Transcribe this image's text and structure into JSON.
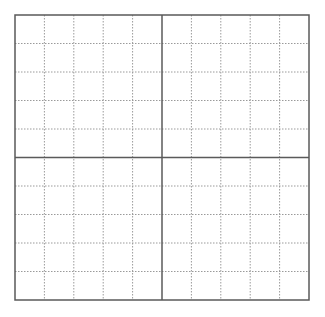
{
  "grid": {
    "left": 15,
    "top": 15,
    "right": 309,
    "bottom": 300,
    "columns": 10,
    "rows": 10,
    "major_divisions": 2,
    "colors": {
      "major_line": "#5a5a5a",
      "minor_line": "#9a9a9a",
      "background": "#ffffff"
    },
    "major_line_width": 1.5,
    "minor_line_width": 1,
    "minor_dash": "1.5,1.5"
  }
}
